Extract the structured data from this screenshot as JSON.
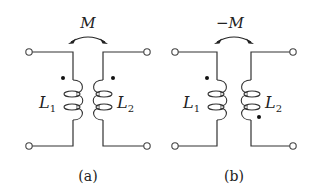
{
  "figures": [
    {
      "caption": "(a)",
      "coupling_label": "M",
      "inductor_left": {
        "symbol": "L",
        "subscript": "1"
      },
      "inductor_right": {
        "symbol": "L",
        "subscript": "2"
      },
      "dot_convention": {
        "left": "top",
        "right": "top"
      }
    },
    {
      "caption": "(b)",
      "coupling_label": "−M",
      "inductor_left": {
        "symbol": "L",
        "subscript": "1"
      },
      "inductor_right": {
        "symbol": "L",
        "subscript": "2"
      },
      "dot_convention": {
        "left": "top",
        "right": "bottom"
      }
    }
  ]
}
